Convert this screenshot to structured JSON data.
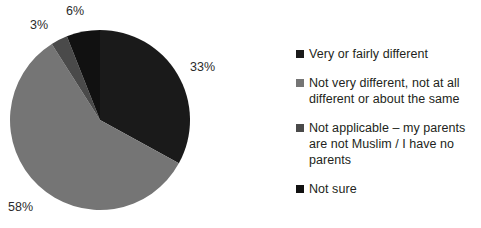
{
  "chart_data": {
    "type": "pie",
    "title": "",
    "subtitle": "",
    "xlabel": "",
    "ylabel": "",
    "grid": false,
    "legend_position": "right",
    "categories": [
      "Very or fairly different",
      "Not very different, not at all different or about the same",
      "Not applicable – my parents are not Muslim / I have no parents",
      "Not sure"
    ],
    "values": [
      33,
      58,
      3,
      6
    ],
    "value_labels": [
      "33%",
      "58%",
      "3%",
      "6%"
    ],
    "colors": [
      "#1a1a1a",
      "#757575",
      "#4a4a4a",
      "#111111"
    ],
    "start_angle_deg": 0,
    "direction": "clockwise",
    "annotations": []
  },
  "pie": {
    "labels": [
      {
        "text": "33%"
      },
      {
        "text": "58%"
      },
      {
        "text": "3%"
      },
      {
        "text": "6%"
      }
    ]
  },
  "legend": {
    "items": [
      {
        "label": "Very or fairly different",
        "color": "#1a1a1a",
        "swatch_name": "legend-swatch-very-or-fairly-different"
      },
      {
        "label": "Not very different, not at all different or about the same",
        "color": "#757575",
        "swatch_name": "legend-swatch-not-very-different"
      },
      {
        "label": "Not applicable – my parents are not Muslim / I have no parents",
        "color": "#4a4a4a",
        "swatch_name": "legend-swatch-not-applicable"
      },
      {
        "label": "Not sure",
        "color": "#111111",
        "swatch_name": "legend-swatch-not-sure"
      }
    ]
  }
}
